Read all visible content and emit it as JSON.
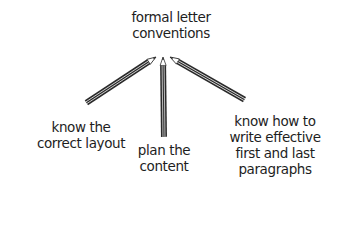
{
  "diagram": {
    "center": {
      "lines": [
        "formal letter",
        "conventions"
      ]
    },
    "branches": [
      {
        "id": "layout",
        "lines": [
          "know the",
          "correct layout"
        ]
      },
      {
        "id": "content",
        "lines": [
          "plan the",
          "content"
        ]
      },
      {
        "id": "paragraphs",
        "lines": [
          "know how to",
          "write effective",
          "first and last",
          "paragraphs"
        ]
      }
    ],
    "connector_style": "pencil",
    "colors": {
      "text": "#1e1e1e",
      "pencil": "#2a2a2a",
      "background": "#ffffff"
    }
  }
}
